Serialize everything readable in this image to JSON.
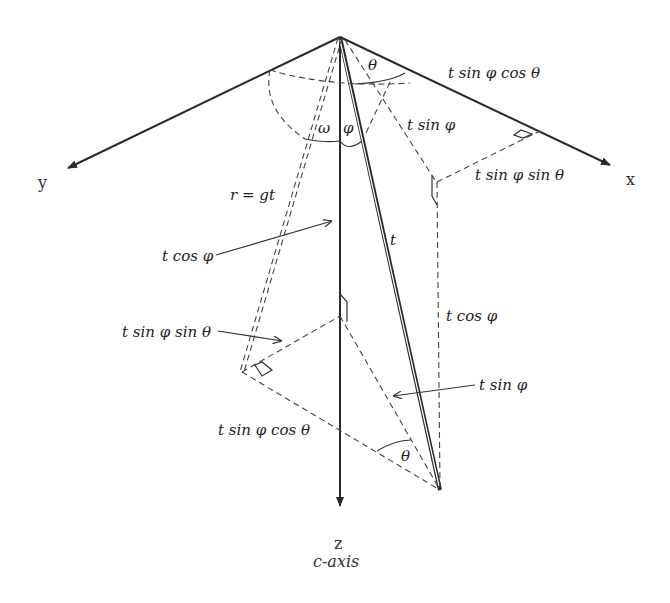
{
  "axes": {
    "x_label": "x",
    "y_label": "y",
    "z_label": "z",
    "z_sublabel": "c-axis"
  },
  "labels": {
    "theta_top": "θ",
    "theta_bottom": "θ",
    "omega": "ω",
    "phi": "φ",
    "t": "t",
    "r_eq": "r = gt",
    "t_sin_phi_cos_theta_top": "t sin φ cos θ",
    "t_sin_phi_top": "t sin φ",
    "t_sin_phi_sin_theta_right": "t sin φ sin θ",
    "t_cos_phi_left": "t cos φ",
    "t_cos_phi_right": "t cos φ",
    "t_sin_phi_sin_theta_left": "t sin φ sin θ",
    "t_sin_phi_right": "t sin φ",
    "t_sin_phi_cos_theta_bottom": "t sin φ cos θ"
  },
  "colors": {
    "line": "#2a2a2a",
    "background": "#ffffff"
  }
}
